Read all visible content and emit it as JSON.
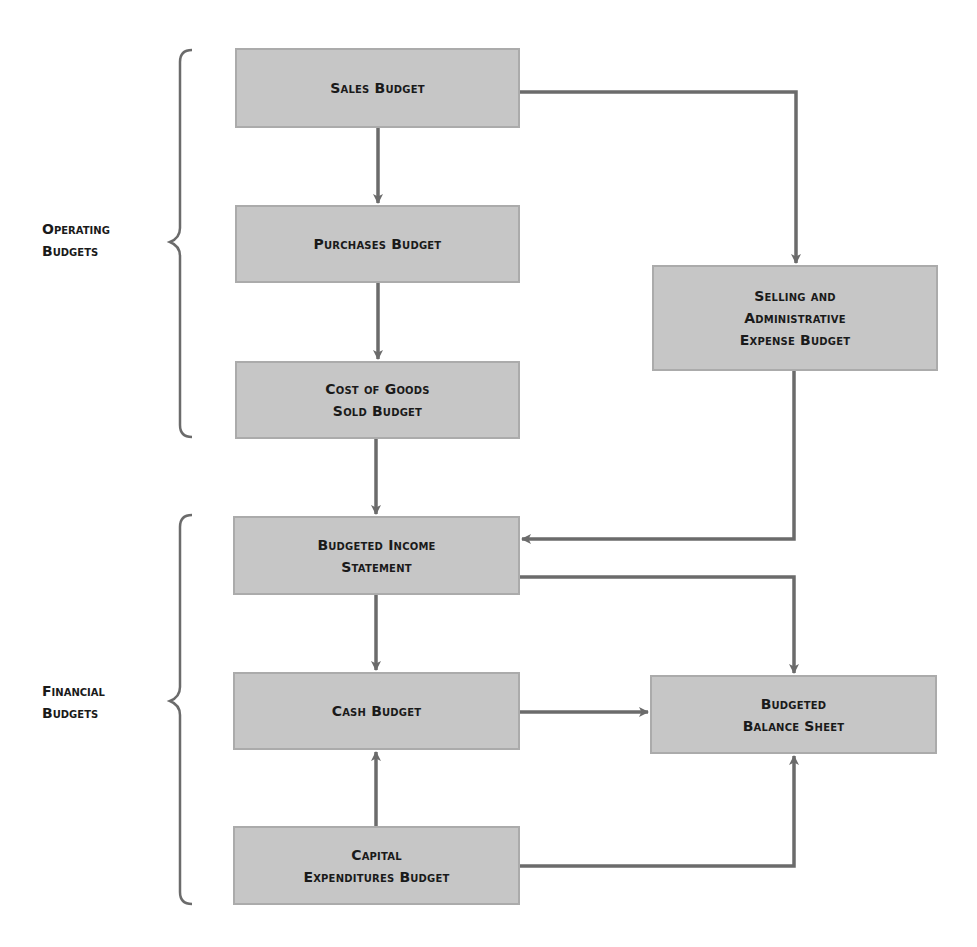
{
  "diagram": {
    "groups": [
      {
        "id": "operating",
        "label_lines": [
          "Operating",
          "Budgets"
        ]
      },
      {
        "id": "financial",
        "label_lines": [
          "Financial",
          "Budgets"
        ]
      }
    ],
    "nodes": {
      "sales": {
        "lines": [
          "Sales Budget"
        ]
      },
      "purchases": {
        "lines": [
          "Purchases Budget"
        ]
      },
      "cogs": {
        "lines": [
          "Cost of Goods",
          "Sold Budget"
        ]
      },
      "selling_admin": {
        "lines": [
          "Selling and",
          "Administrative",
          "Expense Budget"
        ]
      },
      "income": {
        "lines": [
          "Budgeted Income",
          "Statement"
        ]
      },
      "cash": {
        "lines": [
          "Cash Budget"
        ]
      },
      "capital": {
        "lines": [
          "Capital",
          "Expenditures Budget"
        ]
      },
      "balance": {
        "lines": [
          "Budgeted",
          "Balance Sheet"
        ]
      }
    },
    "edges": [
      {
        "from": "sales",
        "to": "purchases"
      },
      {
        "from": "sales",
        "to": "selling_admin"
      },
      {
        "from": "purchases",
        "to": "cogs"
      },
      {
        "from": "cogs",
        "to": "income"
      },
      {
        "from": "selling_admin",
        "to": "income"
      },
      {
        "from": "income",
        "to": "cash"
      },
      {
        "from": "income",
        "to": "balance"
      },
      {
        "from": "cash",
        "to": "balance"
      },
      {
        "from": "capital",
        "to": "cash"
      },
      {
        "from": "capital",
        "to": "balance"
      }
    ],
    "colors": {
      "box_fill": "#c6c6c6",
      "box_border": "#ababab",
      "connector": "#6b6b6b",
      "text": "#1a1a1a"
    }
  }
}
